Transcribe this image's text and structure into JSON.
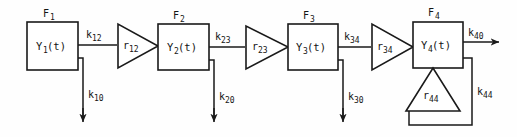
{
  "diagram": {
    "type": "compartmental-block-diagram",
    "title": "",
    "canvas": {
      "width": 517,
      "height": 137,
      "background": "#fefefe"
    },
    "stroke_color": "#1a1a1a",
    "fill_color": "#ffffff",
    "compartments": [
      {
        "id": "c1",
        "compartment_label": "F",
        "compartment_sub": "1",
        "state_label": "Y",
        "state_sub": "1",
        "state_arg": "(t)"
      },
      {
        "id": "c2",
        "compartment_label": "F",
        "compartment_sub": "2",
        "state_label": "Y",
        "state_sub": "2",
        "state_arg": "(t)"
      },
      {
        "id": "c3",
        "compartment_label": "F",
        "compartment_sub": "3",
        "state_label": "Y",
        "state_sub": "3",
        "state_arg": "(t)"
      },
      {
        "id": "c4",
        "compartment_label": "F",
        "compartment_sub": "4",
        "state_label": "Y",
        "state_sub": "4",
        "state_arg": "(t)"
      }
    ],
    "gains": [
      {
        "id": "g12",
        "label": "r",
        "sub": "12",
        "orientation": "right"
      },
      {
        "id": "g23",
        "label": "r",
        "sub": "23",
        "orientation": "right"
      },
      {
        "id": "g34",
        "label": "r",
        "sub": "34",
        "orientation": "right"
      },
      {
        "id": "g44",
        "label": "r",
        "sub": "44",
        "orientation": "up"
      }
    ],
    "transfer_fluxes": [
      {
        "id": "k12",
        "label": "k",
        "sub": "12",
        "from": "c1",
        "to": "g12"
      },
      {
        "id": "k23",
        "label": "k",
        "sub": "23",
        "from": "c2",
        "to": "g23"
      },
      {
        "id": "k34",
        "label": "k",
        "sub": "34",
        "from": "c3",
        "to": "g34"
      }
    ],
    "elimination_fluxes": [
      {
        "id": "k10",
        "label": "k",
        "sub": "10",
        "from": "c1",
        "direction": "down"
      },
      {
        "id": "k20",
        "label": "k",
        "sub": "20",
        "from": "c2",
        "direction": "down"
      },
      {
        "id": "k30",
        "label": "k",
        "sub": "30",
        "from": "c3",
        "direction": "down"
      }
    ],
    "output_fluxes": [
      {
        "id": "k40",
        "label": "k",
        "sub": "40",
        "from": "c4",
        "direction": "right"
      }
    ],
    "feedback_fluxes": [
      {
        "id": "k44",
        "label": "k",
        "sub": "44",
        "from": "c4",
        "to": "g44"
      }
    ]
  }
}
